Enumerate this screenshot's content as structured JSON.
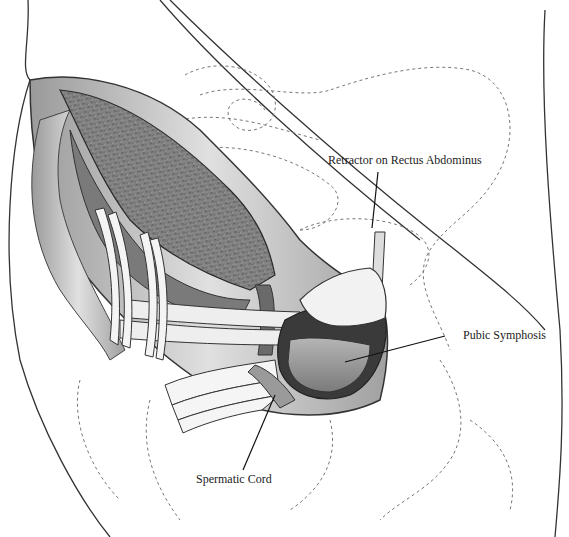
{
  "figure": {
    "type": "surgical anatomical illustration",
    "style": "grayscale pencil/ink rendering",
    "labels": [
      {
        "id": "retractor",
        "text": "Retractor on Rectus Abdominus"
      },
      {
        "id": "pubic",
        "text": "Pubic Symphosis"
      },
      {
        "id": "cord",
        "text": "Spermatic Cord"
      }
    ]
  },
  "colors": {
    "background": "#ffffff",
    "ink": "#222222",
    "muscle_dark": "#5a5a5a",
    "muscle_mid": "#8c8c8c",
    "muscle_light": "#bdbdbd",
    "fat": "#d8d8d8",
    "dashed_bone": "#777777"
  }
}
